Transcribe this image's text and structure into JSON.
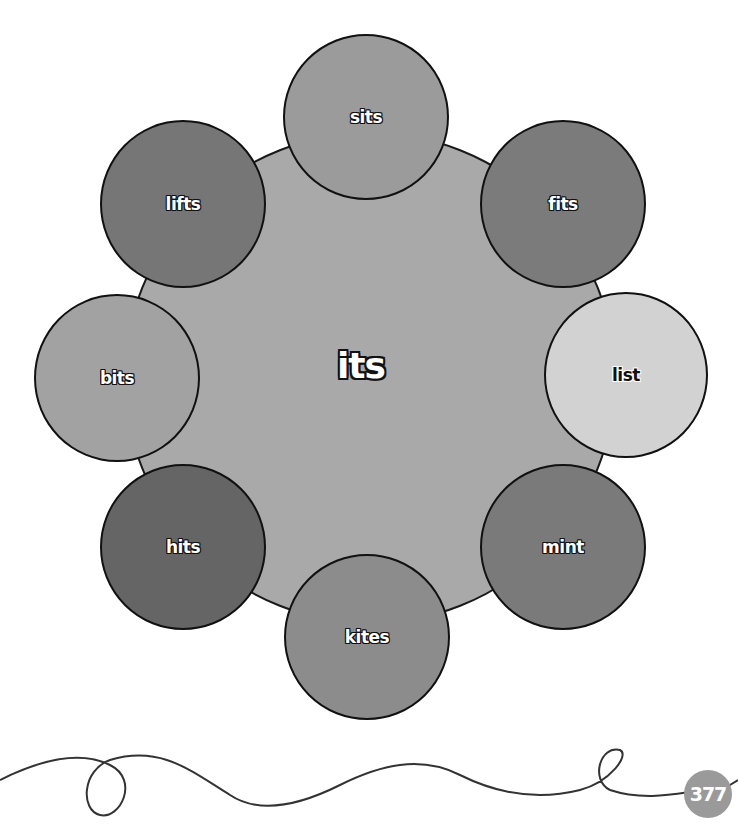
{
  "center": {
    "word": "its",
    "color": "#a9a9a9"
  },
  "circles": [
    {
      "word": "sits",
      "color": "#9b9b9b",
      "cx": 366,
      "cy": 118
    },
    {
      "word": "fits",
      "color": "#7b7b7b",
      "cx": 563,
      "cy": 204
    },
    {
      "word": "list",
      "color": "#d2d2d2",
      "cx": 626,
      "cy": 375
    },
    {
      "word": "mint",
      "color": "#7a7a7a",
      "cx": 563,
      "cy": 547
    },
    {
      "word": "kites",
      "color": "#8c8c8c",
      "cx": 366,
      "cy": 630
    },
    {
      "word": "hits",
      "color": "#656565",
      "cx": 183,
      "cy": 546
    },
    {
      "word": "bits",
      "color": "#a2a2a2",
      "cx": 117,
      "cy": 378
    },
    {
      "word": "lifts",
      "color": "#767676",
      "cx": 183,
      "cy": 204
    }
  ],
  "page_number": "377"
}
